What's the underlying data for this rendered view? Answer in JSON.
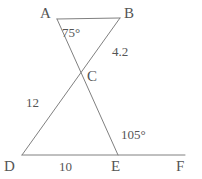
{
  "figure": {
    "type": "geometry-diagram",
    "stroke_color": "#808080",
    "text_color": "#555555",
    "background_color": "#ffffff",
    "stroke_width": 1
  },
  "points": {
    "A": {
      "label": "A",
      "x": 57,
      "y": 19,
      "label_x": 40,
      "label_y": 6
    },
    "B": {
      "label": "B",
      "x": 120,
      "y": 18,
      "label_x": 124,
      "label_y": 6
    },
    "C": {
      "label": "C",
      "x": 82,
      "y": 75,
      "label_x": 87,
      "label_y": 69
    },
    "D": {
      "label": "D",
      "x": 22,
      "y": 155,
      "label_x": 4,
      "label_y": 159
    },
    "E": {
      "label": "E",
      "x": 118,
      "y": 155,
      "label_x": 111,
      "label_y": 159
    },
    "F": {
      "label": "F",
      "x": 185,
      "y": 155,
      "label_x": 176,
      "label_y": 159
    }
  },
  "segments": [
    {
      "name": "segment-AB",
      "from": "A",
      "to": "B"
    },
    {
      "name": "segment-AE",
      "from": "A",
      "to": "E"
    },
    {
      "name": "segment-BD",
      "from": "B",
      "to": "D"
    },
    {
      "name": "segment-DF",
      "from": "D",
      "to": "F"
    }
  ],
  "measures": {
    "angle_A": {
      "text": "75°",
      "x": 62,
      "y": 26
    },
    "side_CB": {
      "text": "4.2",
      "x": 112,
      "y": 45
    },
    "side_DC": {
      "text": "12",
      "x": 26,
      "y": 96
    },
    "side_DE": {
      "text": "10",
      "x": 59,
      "y": 160
    },
    "angle_E_exterior": {
      "text": "105°",
      "x": 121,
      "y": 128
    }
  },
  "chart_data": {
    "type": "diagram",
    "title": "",
    "vertices": [
      "A",
      "B",
      "C",
      "D",
      "E",
      "F"
    ],
    "edges": [
      [
        "A",
        "B"
      ],
      [
        "A",
        "E"
      ],
      [
        "B",
        "D"
      ],
      [
        "D",
        "F"
      ]
    ],
    "annotations": [
      {
        "label": "75°",
        "kind": "angle",
        "at": "A",
        "value": 75,
        "unit": "degrees"
      },
      {
        "label": "4.2",
        "kind": "length",
        "on": "CB",
        "value": 4.2
      },
      {
        "label": "12",
        "kind": "length",
        "on": "DC",
        "value": 12
      },
      {
        "label": "10",
        "kind": "length",
        "on": "DE",
        "value": 10
      },
      {
        "label": "105°",
        "kind": "angle",
        "at": "E",
        "value": 105,
        "unit": "degrees"
      }
    ]
  }
}
